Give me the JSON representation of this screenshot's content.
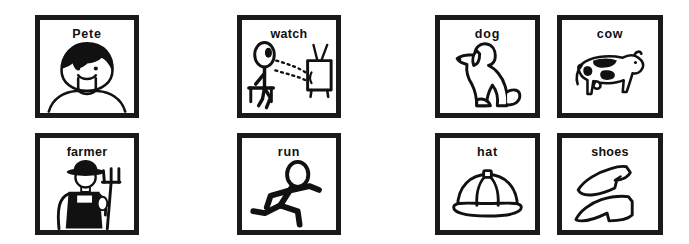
{
  "sheet": {
    "title": "Picture Symbol Flashcards",
    "rows": 2,
    "columns": 4,
    "background_color": "#ffffff",
    "border_color": "#1a1a1a",
    "ink_color": "#111111"
  },
  "cards": [
    {
      "id": "pete",
      "label": "Pete",
      "icon": "boy-face-icon",
      "category": "person",
      "row": 1,
      "column": 1
    },
    {
      "id": "farmer",
      "label": "farmer",
      "icon": "farmer-with-pitchfork-icon",
      "category": "person",
      "row": 2,
      "column": 1
    },
    {
      "id": "watch",
      "label": "watch",
      "icon": "person-watching-television-icon",
      "category": "verb",
      "row": 1,
      "column": 2
    },
    {
      "id": "run",
      "label": "run",
      "icon": "running-stick-figure-icon",
      "category": "verb",
      "row": 2,
      "column": 2
    },
    {
      "id": "dog",
      "label": "dog",
      "icon": "sitting-dog-icon",
      "category": "animal",
      "row": 1,
      "column": 3
    },
    {
      "id": "hat",
      "label": "hat",
      "icon": "baseball-cap-icon",
      "category": "object",
      "row": 2,
      "column": 3
    },
    {
      "id": "cow",
      "label": "cow",
      "icon": "spotted-cow-icon",
      "category": "animal",
      "row": 1,
      "column": 4
    },
    {
      "id": "shoes",
      "label": "shoes",
      "icon": "pair-of-shoes-icon",
      "category": "object",
      "row": 2,
      "column": 4
    }
  ]
}
